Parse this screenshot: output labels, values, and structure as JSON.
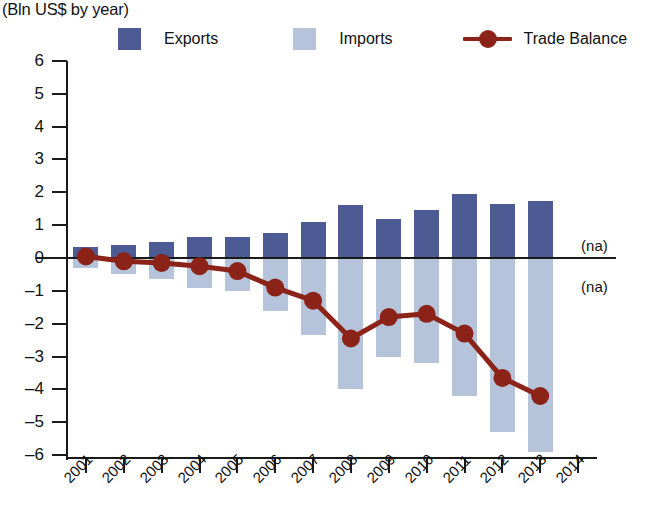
{
  "header": {
    "title_partial": "",
    "subtitle": "(Bln US$ by year)"
  },
  "legend": {
    "position": "top",
    "items": [
      {
        "label": "Exports",
        "color": "#4c5b93",
        "marker": "square-swatch"
      },
      {
        "label": "Imports",
        "color": "#b5c4da",
        "marker": "square-swatch"
      },
      {
        "label": "Trade Balance",
        "color": "#8b2318",
        "marker": "line-with-dot"
      }
    ]
  },
  "annotations": [
    {
      "text": "(na)",
      "x_category": "2014",
      "y_value": 0.35
    },
    {
      "text": "(na)",
      "x_category": "2014",
      "y_value": -0.9
    }
  ],
  "chart_data": {
    "type": "bar",
    "title": "",
    "subtitle": "(Bln US$ by year)",
    "xlabel": "",
    "ylabel": "",
    "ylim": [
      -6,
      6
    ],
    "ytick_labels": [
      "6",
      "5",
      "4",
      "3",
      "2",
      "1",
      "0",
      "–1",
      "–2",
      "–3",
      "–4",
      "–5",
      "–6"
    ],
    "ytick_values": [
      6,
      5,
      4,
      3,
      2,
      1,
      0,
      -1,
      -2,
      -3,
      -4,
      -5,
      -6
    ],
    "grid": false,
    "categories": [
      "2001",
      "2002",
      "2003",
      "2004",
      "2005",
      "2006",
      "2007",
      "2008",
      "2009",
      "2010",
      "2011",
      "2012",
      "2013",
      "2014"
    ],
    "series": [
      {
        "name": "Exports",
        "type": "bar",
        "color": "#4c5b93",
        "values": [
          0.35,
          0.4,
          0.5,
          0.65,
          0.65,
          0.75,
          1.1,
          1.6,
          1.2,
          1.45,
          1.95,
          1.65,
          1.75,
          null
        ]
      },
      {
        "name": "Imports",
        "type": "bar",
        "color": "#b5c4da",
        "values": [
          -0.3,
          -0.5,
          -0.65,
          -0.9,
          -1.0,
          -1.6,
          -2.35,
          -4.0,
          -3.0,
          -3.2,
          -4.2,
          -5.3,
          -5.9,
          null
        ]
      },
      {
        "name": "Trade Balance",
        "type": "line",
        "color": "#8b2318",
        "values": [
          0.05,
          -0.1,
          -0.15,
          -0.25,
          -0.4,
          -0.9,
          -1.3,
          -2.45,
          -1.8,
          -1.7,
          -2.3,
          -3.65,
          -4.2,
          null
        ]
      }
    ]
  }
}
